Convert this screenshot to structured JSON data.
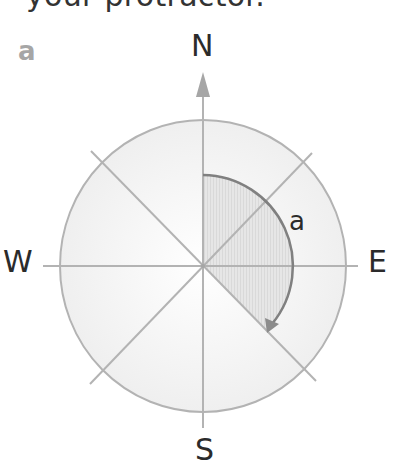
{
  "intro_text": "your protractor.",
  "part_label": "a",
  "compass": {
    "north": "N",
    "east": "E",
    "south": "S",
    "west": "W"
  },
  "angle": {
    "label": "a",
    "from_direction": "N",
    "to_direction": "SE",
    "direction": "clockwise",
    "degrees_depicted": 135
  },
  "colors": {
    "line": "#b3b3b3",
    "circle_fill": "#f4f4f4",
    "shaded_sector": "#e3e3e3",
    "arc": "#808080",
    "text": "#2b2b2b",
    "part_label": "#a6a6a6"
  }
}
